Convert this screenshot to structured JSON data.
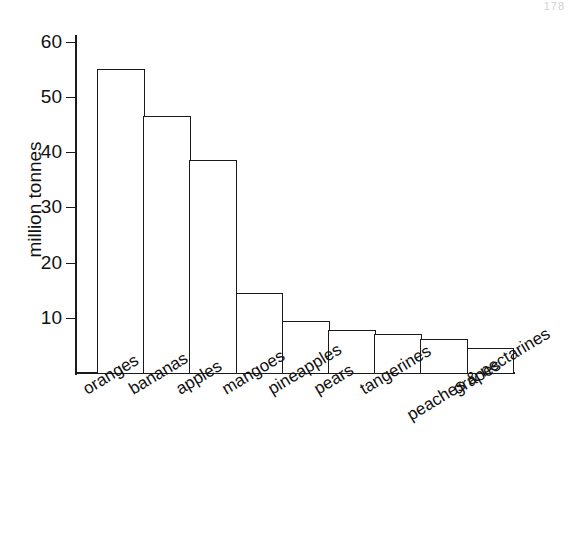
{
  "page": {
    "artifact_text": "178"
  },
  "chart_data": {
    "type": "bar",
    "title": "",
    "xlabel": "",
    "ylabel": "million tonnes",
    "categories": [
      "oranges",
      "bananas",
      "apples",
      "mangoes",
      "pineapples",
      "pears",
      "tangerines",
      "peaches & nectarines",
      "grapes"
    ],
    "values": [
      55,
      46.5,
      38.5,
      14.5,
      9.4,
      7.8,
      7,
      6.2,
      4.6
    ],
    "ylim": [
      0,
      60
    ],
    "ytick_labels": [
      "10",
      "20",
      "30",
      "40",
      "50",
      "60"
    ],
    "ytick_values": [
      10,
      20,
      30,
      40,
      50,
      60
    ],
    "grid": false,
    "legend": "none",
    "bar_fill_color": "#ffffff",
    "bar_edge_color": "#1a1a1a",
    "axis_color": "#1a1a1a"
  }
}
